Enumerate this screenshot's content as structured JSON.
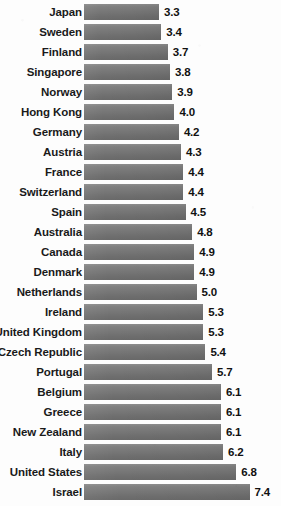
{
  "chart_data": {
    "type": "bar",
    "orientation": "horizontal",
    "title": "",
    "subtitle": "",
    "xlabel": "",
    "ylabel": "",
    "grid": false,
    "legend": null,
    "xlim": [
      0,
      7.4
    ],
    "value_format": "one-decimal",
    "categories": [
      "Japan",
      "Sweden",
      "Finland",
      "Singapore",
      "Norway",
      "Hong Kong",
      "Germany",
      "Austria",
      "France",
      "Switzerland",
      "Spain",
      "Australia",
      "Canada",
      "Denmark",
      "Netherlands",
      "Ireland",
      "United Kingdom",
      "Czech Republic",
      "Portugal",
      "Belgium",
      "Greece",
      "New Zealand",
      "Italy",
      "United States",
      "Israel"
    ],
    "values": [
      3.3,
      3.4,
      3.7,
      3.8,
      3.9,
      4.0,
      4.2,
      4.3,
      4.4,
      4.4,
      4.5,
      4.8,
      4.9,
      4.9,
      5.0,
      5.3,
      5.3,
      5.4,
      5.7,
      6.1,
      6.1,
      6.1,
      6.2,
      6.8,
      7.4
    ],
    "value_labels": [
      "3.3",
      "3.4",
      "3.7",
      "3.8",
      "3.9",
      "4.0",
      "4.2",
      "4.3",
      "4.4",
      "4.4",
      "4.5",
      "4.8",
      "4.9",
      "4.9",
      "5.0",
      "5.3",
      "5.3",
      "5.4",
      "5.7",
      "6.1",
      "6.1",
      "6.1",
      "6.2",
      "6.8",
      "7.4"
    ],
    "colors": {
      "bar_top": "#8d8d8d",
      "bar_bottom": "#6a6a6a",
      "label_text": "#1a1a1a",
      "value_text": "#111111",
      "background": "#fdfdfd"
    }
  }
}
